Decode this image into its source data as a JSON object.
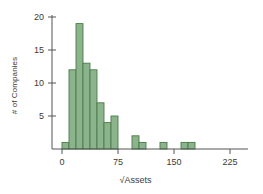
{
  "chart_data": {
    "type": "bar",
    "title": "",
    "subtitle": "",
    "xlabel": "√Assets",
    "ylabel": "# of Companies",
    "xlim": [
      -7.5,
      247.5
    ],
    "ylim": [
      0,
      20
    ],
    "xticks": [
      0,
      75,
      150,
      225
    ],
    "xtick_labels": [
      "0",
      "75",
      "150",
      "225"
    ],
    "yticks": [
      5,
      10,
      15,
      20
    ],
    "ytick_labels": [
      "5",
      "10",
      "15",
      "20"
    ],
    "grid": false,
    "legend": null,
    "bin_width": 9.375,
    "bin_starts": [
      0,
      9.375,
      18.75,
      28.125,
      37.5,
      46.875,
      56.25,
      65.625,
      75,
      84.375,
      93.75,
      103.125,
      112.5,
      121.875,
      131.25,
      140.625,
      150,
      159.375,
      168.75,
      178.125,
      187.5,
      196.875,
      206.25,
      215.625,
      225,
      234.375
    ],
    "categories": [
      "0-9.4",
      "9.4-18.8",
      "18.8-28.1",
      "28.1-37.5",
      "37.5-46.9",
      "46.9-56.3",
      "56.3-65.6",
      "65.6-75",
      "75-84.4",
      "84.4-93.8",
      "93.8-103.1",
      "103.1-112.5",
      "112.5-121.9",
      "121.9-131.3",
      "131.3-140.6",
      "140.6-150",
      "150-159.4",
      "159.4-168.8",
      "168.8-178.1",
      "178.1-187.5",
      "187.5-196.9",
      "196.9-206.3",
      "206.3-215.6",
      "215.6-225",
      "225-234.4",
      "234.4-243.8"
    ],
    "values": [
      1,
      12,
      19,
      13,
      12,
      7,
      4,
      5,
      0,
      0,
      2,
      1,
      0,
      0,
      1,
      0,
      0,
      1,
      1,
      0,
      0,
      0,
      0,
      0,
      0,
      0
    ],
    "bar_fill_color": "#8cb48c",
    "bar_border_color": "#4a7a4a",
    "axis_color": "#555555",
    "text_color": "#3b3b3b"
  }
}
